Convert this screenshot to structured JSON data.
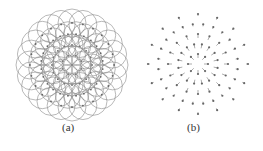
{
  "figure": {
    "panels": [
      {
        "label": "(a)",
        "description": "overlapping circles arranged on concentric rings with center dots",
        "center": [
          72,
          65
        ],
        "rings": [
          0,
          10,
          20,
          31,
          42
        ],
        "points_per_ring": [
          1,
          8,
          16,
          24,
          24
        ],
        "circle_radius": 14
      },
      {
        "label": "(b)",
        "description": "radial arrows pointing toward the center",
        "center": [
          198,
          64
        ],
        "rings": [
          10,
          20,
          30,
          40,
          50
        ],
        "points_per_ring": [
          8,
          16,
          16,
          24,
          16
        ]
      }
    ]
  },
  "colors": {
    "stroke": "#8a8a8a",
    "dot": "#666666",
    "text": "#333333"
  }
}
